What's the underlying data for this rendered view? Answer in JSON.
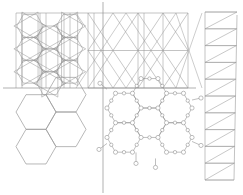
{
  "figure": {
    "background_color": "#ffffff",
    "line_color": "#9a9a9a",
    "line_color_dark": "#8a8a8a",
    "axis_color": "#8f8f8f",
    "atom_fill": "#ffffff",
    "atom_stroke": "#8a8a8a",
    "width": 243,
    "height": 195
  },
  "axes": {
    "horizontal": {
      "label": "horizontal-axis",
      "y": 88,
      "x1": 3,
      "x2": 196
    },
    "vertical": {
      "label": "vertical-axis",
      "x": 103,
      "y1": 2,
      "y2": 193
    }
  },
  "panels": [
    {
      "id": "top-left-star-tiling",
      "label": "Hexagon and star tiling",
      "x": 16,
      "y": 13,
      "width": 72,
      "height": 75,
      "description": "Hexagons overlaid with six-pointed star polygons and vertical rails"
    },
    {
      "id": "top-right-triangular-lattice",
      "label": "Triangular lattice",
      "x": 88,
      "y": 13,
      "width": 100,
      "height": 75,
      "description": "Large triangular net with vertical rails"
    },
    {
      "id": "bottom-left-honeycomb",
      "label": "Honeycomb cells",
      "x": 14,
      "y": 92,
      "width": 90,
      "height": 95,
      "description": "Four plain hexagonal cells in honeycomb arrangement"
    },
    {
      "id": "bottom-right-molecule",
      "label": "Ball and stick honeycomb network",
      "x": 100,
      "y": 86,
      "width": 90,
      "height": 103,
      "description": "Atoms as small circles joined by bonds forming fused rings"
    },
    {
      "id": "right-triangle-ladder",
      "label": "Triangulated vertical strip",
      "x": 205,
      "y": 12,
      "width": 32,
      "height": 168,
      "description": "Narrow vertical strip subdivided into zig-zag triangles",
      "triangle_count": 10
    }
  ],
  "chart_data": {
    "type": "line",
    "xlabel": "",
    "ylabel": "",
    "grid": false,
    "legend": "none",
    "series": [
      {
        "name": "star-tiling",
        "points": 0
      },
      {
        "name": "triangular-lattice",
        "points": 0
      },
      {
        "name": "honeycomb",
        "points": 0
      },
      {
        "name": "molecular-network",
        "points": 0
      },
      {
        "name": "triangle-ladder",
        "points": 0
      }
    ]
  }
}
